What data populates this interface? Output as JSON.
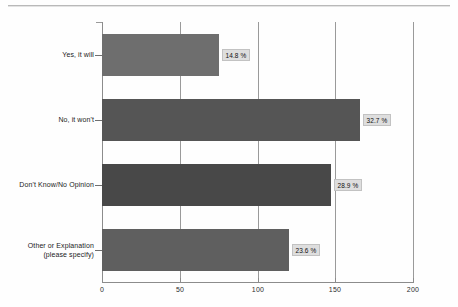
{
  "page": {
    "background_color": "#fefefe",
    "rule_color": "#b9b9b9"
  },
  "chart_data": {
    "type": "bar",
    "orientation": "horizontal",
    "title": "",
    "subtitle": "",
    "xlabel": "",
    "ylabel": "",
    "categories": [
      "Yes, it will",
      "No, it won't",
      "Don't Know/No Opinion",
      "Other or Explanation\n(please specify)"
    ],
    "values": [
      75,
      166,
      147,
      120
    ],
    "value_labels": [
      "14.8 %",
      "32.7 %",
      "28.9 %",
      "23.6 %"
    ],
    "percentages": [
      14.8,
      32.7,
      28.9,
      23.6
    ],
    "series": [
      {
        "name": "Responses",
        "values": [
          75,
          166,
          147,
          120
        ]
      }
    ],
    "xlim": [
      0,
      200
    ],
    "xticks": [
      0,
      50,
      100,
      150,
      200
    ],
    "xtick_labels": [
      "0",
      "50",
      "100",
      "150",
      "200"
    ],
    "grid": true,
    "grid_axis": "x",
    "legend": false,
    "legend_position": "none",
    "bar_colors": [
      "#6e6e6e",
      "#555555",
      "#484848",
      "#5f5f5f"
    ],
    "axis_color": "#8c8c8c",
    "label_box_fill": "#dedede",
    "label_box_border": "#c2c2c2"
  }
}
